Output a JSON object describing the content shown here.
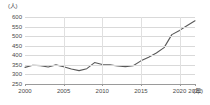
{
  "chart_data": {
    "type": "line",
    "title": "",
    "subtitle": "",
    "xlabel": "年",
    "ylabel": "人",
    "y_unit_label": "(人)",
    "x_unit_label": "(年)",
    "xlim": [
      2000,
      2022
    ],
    "ylim": [
      250,
      600
    ],
    "y_ticks": [
      600,
      550,
      500,
      450,
      400,
      350,
      300,
      250
    ],
    "y_tick_labels": [
      "600",
      "550",
      "500",
      "450",
      "400",
      "350",
      "300",
      "250"
    ],
    "x_ticks": [
      2000,
      2005,
      2010,
      2015,
      2020,
      2022
    ],
    "x_tick_labels": [
      "2000",
      "2005",
      "2010",
      "2015",
      "2020",
      "2022"
    ],
    "grid": "horizontal-and-vertical",
    "legend": "none",
    "line_color": "#595959",
    "series": [
      {
        "name": "人数",
        "x": [
          2000,
          2001,
          2002,
          2003,
          2004,
          2005,
          2006,
          2007,
          2008,
          2009,
          2010,
          2011,
          2012,
          2013,
          2014,
          2015,
          2016,
          2017,
          2018,
          2019,
          2020,
          2021,
          2022
        ],
        "values": [
          337,
          348,
          346,
          339,
          350,
          340,
          328,
          320,
          330,
          362,
          352,
          350,
          344,
          341,
          345,
          371,
          390,
          412,
          440,
          508,
          530,
          556,
          580
        ]
      }
    ]
  },
  "axis": {
    "y_unit": "(人)",
    "x_unit": "(年)"
  }
}
